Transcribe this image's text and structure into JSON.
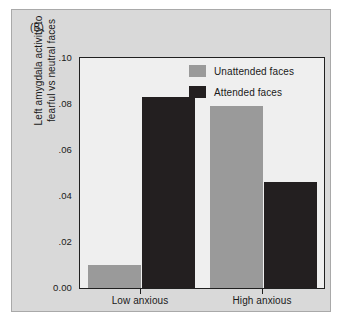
{
  "figure": {
    "panel_letter": "(B)",
    "background_color": "#d9d9d9",
    "plot_background_color": "#efefef",
    "frame_color": "#a9a9a9"
  },
  "chart_data": {
    "type": "bar",
    "title": "(B)",
    "xlabel": "",
    "ylabel": "Left amygdala activity to fearful vs neutral faces",
    "ylabel_lines": [
      "Left amygdala activity to",
      "fearful vs neutral faces"
    ],
    "categories": [
      "Low anxious",
      "High anxious"
    ],
    "series": [
      {
        "name": "Unattended faces",
        "color": "#9a9a9a",
        "values": [
          0.01,
          0.079
        ]
      },
      {
        "name": "Attended faces",
        "color": "#231f20",
        "values": [
          0.083,
          0.046
        ]
      }
    ],
    "ylim": [
      0.0,
      0.1
    ],
    "ytick_values": [
      0.1,
      0.08,
      0.06,
      0.04,
      0.02,
      0.0
    ],
    "ytick_labels": [
      ".10",
      ".08",
      ".06",
      ".04",
      ".02",
      "0.00"
    ],
    "grid": false,
    "legend_position": "top-center-right",
    "legend_entries": [
      "Unattended faces",
      "Attended faces"
    ]
  }
}
